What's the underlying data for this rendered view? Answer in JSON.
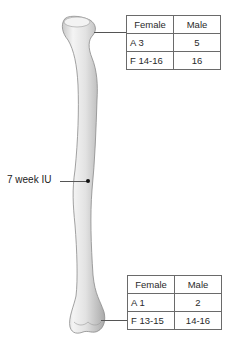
{
  "diagram": {
    "primary_center_label": "7 week IU",
    "proximal_table": {
      "headers": [
        "Female",
        "Male"
      ],
      "rows": [
        [
          "A 3",
          "5"
        ],
        [
          "F 14-16",
          "16"
        ]
      ]
    },
    "distal_table": {
      "headers": [
        "Female",
        "Male"
      ],
      "rows": [
        [
          "A 1",
          "2"
        ],
        [
          "F 13-15",
          "14-16"
        ]
      ]
    },
    "colors": {
      "bone_fill": "#ececec",
      "bone_shade": "#b8b8b8",
      "line": "#555555",
      "table_border": "#6a6a6a"
    }
  }
}
